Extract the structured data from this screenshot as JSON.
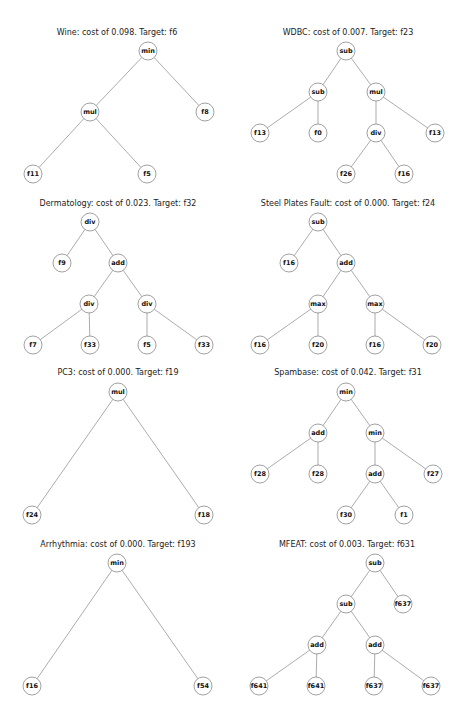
{
  "figure": {
    "panels": [
      {
        "id": "wine",
        "title": "Wine: cost of 0.098. Target: f6",
        "title_pos": [
          117,
          35
        ],
        "nodes": [
          {
            "id": 0,
            "label": "min",
            "x": 148,
            "y": 51
          },
          {
            "id": 1,
            "label": "mul",
            "x": 90,
            "y": 112
          },
          {
            "id": 2,
            "label": "f8",
            "x": 205,
            "y": 112
          },
          {
            "id": 3,
            "label": "f11",
            "x": 33,
            "y": 174
          },
          {
            "id": 4,
            "label": "f5",
            "x": 147,
            "y": 174
          }
        ],
        "edges": [
          [
            0,
            1
          ],
          [
            0,
            2
          ],
          [
            1,
            3
          ],
          [
            1,
            4
          ]
        ]
      },
      {
        "id": "wdbc",
        "title": "WDBC: cost of 0.007. Target: f23",
        "title_pos": [
          348,
          35
        ],
        "nodes": [
          {
            "id": 0,
            "label": "sub",
            "x": 346,
            "y": 51
          },
          {
            "id": 1,
            "label": "sub",
            "x": 318,
            "y": 92
          },
          {
            "id": 2,
            "label": "mul",
            "x": 376,
            "y": 92
          },
          {
            "id": 3,
            "label": "f13",
            "x": 260,
            "y": 133
          },
          {
            "id": 4,
            "label": "f0",
            "x": 318,
            "y": 133
          },
          {
            "id": 5,
            "label": "div",
            "x": 376,
            "y": 133
          },
          {
            "id": 6,
            "label": "f13",
            "x": 435,
            "y": 133
          },
          {
            "id": 7,
            "label": "f26",
            "x": 346,
            "y": 174
          },
          {
            "id": 8,
            "label": "f16",
            "x": 404,
            "y": 174
          }
        ],
        "edges": [
          [
            0,
            1
          ],
          [
            0,
            2
          ],
          [
            1,
            3
          ],
          [
            1,
            4
          ],
          [
            2,
            5
          ],
          [
            2,
            6
          ],
          [
            5,
            7
          ],
          [
            5,
            8
          ]
        ]
      },
      {
        "id": "dermatology",
        "title": "Dermatology: cost of 0.023. Target: f32",
        "title_pos": [
          118,
          206
        ],
        "nodes": [
          {
            "id": 0,
            "label": "div",
            "x": 90,
            "y": 222
          },
          {
            "id": 1,
            "label": "f9",
            "x": 62,
            "y": 263
          },
          {
            "id": 2,
            "label": "add",
            "x": 118,
            "y": 263
          },
          {
            "id": 3,
            "label": "div",
            "x": 89,
            "y": 304
          },
          {
            "id": 4,
            "label": "div",
            "x": 147,
            "y": 304
          },
          {
            "id": 5,
            "label": "f7",
            "x": 33,
            "y": 345
          },
          {
            "id": 6,
            "label": "f33",
            "x": 90,
            "y": 345
          },
          {
            "id": 7,
            "label": "f5",
            "x": 147,
            "y": 345
          },
          {
            "id": 8,
            "label": "f33",
            "x": 204,
            "y": 345
          }
        ],
        "edges": [
          [
            0,
            1
          ],
          [
            0,
            2
          ],
          [
            2,
            3
          ],
          [
            2,
            4
          ],
          [
            3,
            5
          ],
          [
            3,
            6
          ],
          [
            4,
            7
          ],
          [
            4,
            8
          ]
        ]
      },
      {
        "id": "steel-plates-fault",
        "title": "Steel Plates Fault: cost of 0.000. Target: f24",
        "title_pos": [
          348,
          206
        ],
        "nodes": [
          {
            "id": 0,
            "label": "sub",
            "x": 318,
            "y": 222
          },
          {
            "id": 1,
            "label": "f16",
            "x": 289,
            "y": 263
          },
          {
            "id": 2,
            "label": "add",
            "x": 346,
            "y": 263
          },
          {
            "id": 3,
            "label": "max",
            "x": 318,
            "y": 304
          },
          {
            "id": 4,
            "label": "max",
            "x": 375,
            "y": 304
          },
          {
            "id": 5,
            "label": "f16",
            "x": 260,
            "y": 345
          },
          {
            "id": 6,
            "label": "f20",
            "x": 318,
            "y": 345
          },
          {
            "id": 7,
            "label": "f16",
            "x": 375,
            "y": 345
          },
          {
            "id": 8,
            "label": "f20",
            "x": 432,
            "y": 345
          }
        ],
        "edges": [
          [
            0,
            1
          ],
          [
            0,
            2
          ],
          [
            2,
            3
          ],
          [
            2,
            4
          ],
          [
            3,
            5
          ],
          [
            3,
            6
          ],
          [
            4,
            7
          ],
          [
            4,
            8
          ]
        ]
      },
      {
        "id": "pc3",
        "title": "PC3: cost of 0.000. Target: f19",
        "title_pos": [
          118,
          375
        ],
        "nodes": [
          {
            "id": 0,
            "label": "mul",
            "x": 118,
            "y": 392
          },
          {
            "id": 1,
            "label": "f24",
            "x": 32,
            "y": 515
          },
          {
            "id": 2,
            "label": "f18",
            "x": 204,
            "y": 515
          }
        ],
        "edges": [
          [
            0,
            1
          ],
          [
            0,
            2
          ]
        ]
      },
      {
        "id": "spambase",
        "title": "Spambase: cost of 0.042. Target: f31",
        "title_pos": [
          348,
          375
        ],
        "nodes": [
          {
            "id": 0,
            "label": "min",
            "x": 346,
            "y": 392
          },
          {
            "id": 1,
            "label": "add",
            "x": 318,
            "y": 433
          },
          {
            "id": 2,
            "label": "min",
            "x": 375,
            "y": 433
          },
          {
            "id": 3,
            "label": "f28",
            "x": 260,
            "y": 474
          },
          {
            "id": 4,
            "label": "f28",
            "x": 318,
            "y": 474
          },
          {
            "id": 5,
            "label": "add",
            "x": 375,
            "y": 474
          },
          {
            "id": 6,
            "label": "f27",
            "x": 433,
            "y": 474
          },
          {
            "id": 7,
            "label": "f30",
            "x": 346,
            "y": 515
          },
          {
            "id": 8,
            "label": "f1",
            "x": 404,
            "y": 515
          }
        ],
        "edges": [
          [
            0,
            1
          ],
          [
            0,
            2
          ],
          [
            1,
            3
          ],
          [
            1,
            4
          ],
          [
            2,
            5
          ],
          [
            2,
            6
          ],
          [
            5,
            7
          ],
          [
            5,
            8
          ]
        ]
      },
      {
        "id": "arrhythmia",
        "title": "Arrhythmia: cost of 0.000. Target: f193",
        "title_pos": [
          118,
          547
        ],
        "nodes": [
          {
            "id": 0,
            "label": "min",
            "x": 117,
            "y": 563
          },
          {
            "id": 1,
            "label": "f16",
            "x": 32,
            "y": 686
          },
          {
            "id": 2,
            "label": "f54",
            "x": 203,
            "y": 686
          }
        ],
        "edges": [
          [
            0,
            1
          ],
          [
            0,
            2
          ]
        ]
      },
      {
        "id": "mfeat",
        "title": "MFEAT: cost of 0.003. Target: f631",
        "title_pos": [
          347,
          547
        ],
        "nodes": [
          {
            "id": 0,
            "label": "sub",
            "x": 375,
            "y": 563
          },
          {
            "id": 1,
            "label": "sub",
            "x": 346,
            "y": 604
          },
          {
            "id": 2,
            "label": "f637",
            "x": 403,
            "y": 604
          },
          {
            "id": 3,
            "label": "add",
            "x": 317,
            "y": 645
          },
          {
            "id": 4,
            "label": "add",
            "x": 375,
            "y": 645
          },
          {
            "id": 5,
            "label": "f641",
            "x": 259,
            "y": 686
          },
          {
            "id": 6,
            "label": "f641",
            "x": 316,
            "y": 686
          },
          {
            "id": 7,
            "label": "f637",
            "x": 374,
            "y": 686
          },
          {
            "id": 8,
            "label": "f637",
            "x": 431,
            "y": 686
          }
        ],
        "edges": [
          [
            0,
            1
          ],
          [
            0,
            2
          ],
          [
            1,
            3
          ],
          [
            1,
            4
          ],
          [
            3,
            5
          ],
          [
            3,
            6
          ],
          [
            4,
            7
          ],
          [
            4,
            8
          ]
        ]
      }
    ],
    "style": {
      "node_radius": 9,
      "edge_color": "#888888",
      "node_stroke": "#777777",
      "node_fill": "#ffffff",
      "text_color": "#111111"
    }
  }
}
